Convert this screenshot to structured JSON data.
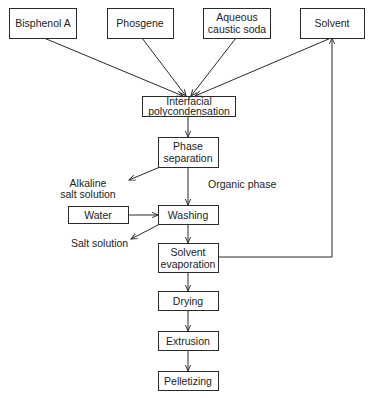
{
  "diagram": {
    "type": "process-flowchart",
    "nodes": {
      "bisphenol_a": [
        "Bisphenol A"
      ],
      "phosgene": [
        "Phosgene"
      ],
      "caustic_soda": [
        "Aqueous",
        "caustic soda"
      ],
      "solvent": [
        "Solvent"
      ],
      "interfacial": [
        "Interfacial",
        "polycondensation"
      ],
      "phase_separation": [
        "Phase",
        "separation"
      ],
      "water": [
        "Water"
      ],
      "washing": [
        "Washing"
      ],
      "solvent_evaporation": [
        "Solvent",
        "evaporation"
      ],
      "drying": [
        "Drying"
      ],
      "extrusion": [
        "Extrusion"
      ],
      "pelletizing": [
        "Pelletizing"
      ]
    },
    "annotations": {
      "alkaline_salt_solution": [
        "Alkaline",
        "salt solution"
      ],
      "organic_phase": [
        "Organic phase"
      ],
      "salt_solution": [
        "Salt solution"
      ]
    },
    "edges": [
      {
        "from": "bisphenol_a",
        "to": "interfacial"
      },
      {
        "from": "phosgene",
        "to": "interfacial"
      },
      {
        "from": "caustic_soda",
        "to": "interfacial"
      },
      {
        "from": "solvent",
        "to": "interfacial"
      },
      {
        "from": "interfacial",
        "to": "phase_separation"
      },
      {
        "from": "phase_separation",
        "to": "alkaline_salt_solution"
      },
      {
        "from": "phase_separation",
        "to": "washing",
        "label": "Organic phase"
      },
      {
        "from": "water",
        "to": "washing"
      },
      {
        "from": "washing",
        "to": "salt_solution"
      },
      {
        "from": "washing",
        "to": "solvent_evaporation"
      },
      {
        "from": "solvent_evaporation",
        "to": "solvent",
        "note": "solvent recycle"
      },
      {
        "from": "solvent_evaporation",
        "to": "drying"
      },
      {
        "from": "drying",
        "to": "extrusion"
      },
      {
        "from": "extrusion",
        "to": "pelletizing"
      }
    ]
  }
}
